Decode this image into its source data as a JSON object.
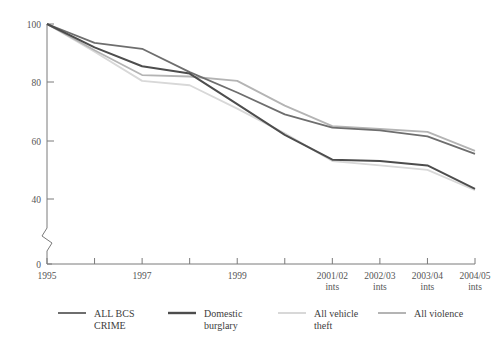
{
  "chart_data": {
    "type": "line",
    "title": "",
    "subtitle": "",
    "xlabel": "",
    "ylabel": "",
    "ylim": [
      0,
      100
    ],
    "y_ticks": [
      0,
      40,
      60,
      80,
      100
    ],
    "y_axis_break": true,
    "y_axis_break_between": [
      0,
      40
    ],
    "grid": false,
    "legend_position": "bottom",
    "categories": [
      "1995",
      "1996",
      "1997",
      "1998",
      "1999",
      "2000",
      "2001/02 ints",
      "2002/03 ints",
      "2003/04 ints",
      "2004/05 ints"
    ],
    "x_tick_labels": [
      "1995",
      "",
      "1997",
      "",
      "1999",
      "",
      "2001/02\nints",
      "2002/03\nints",
      "2003/04\nints",
      "2004/05\nints"
    ],
    "x_tick_labels_visible": [
      {
        "index": 0,
        "line1": "1995",
        "line2": ""
      },
      {
        "index": 2,
        "line1": "1997",
        "line2": ""
      },
      {
        "index": 4,
        "line1": "1999",
        "line2": ""
      },
      {
        "index": 6,
        "line1": "2001/02",
        "line2": "ints"
      },
      {
        "index": 7,
        "line1": "2002/03",
        "line2": "ints"
      },
      {
        "index": 8,
        "line1": "2003/04",
        "line2": "ints"
      },
      {
        "index": 9,
        "line1": "2004/05",
        "line2": "ints"
      }
    ],
    "series": [
      {
        "name": "ALL BCS CRIME",
        "color": "#6e6e6e",
        "values": [
          100,
          93.5,
          91.5,
          83.5,
          76.5,
          69.0,
          64.5,
          63.5,
          61.5,
          55.5
        ]
      },
      {
        "name": "Domestic burglary",
        "color": "#4d4d4d",
        "values": [
          100,
          92.0,
          85.5,
          83.0,
          72.5,
          62.0,
          53.5,
          53.0,
          51.5,
          43.5
        ]
      },
      {
        "name": "All vehicle theft",
        "color": "#d8d8d8",
        "values": [
          100,
          90.5,
          80.5,
          79.0,
          71.0,
          62.5,
          53.0,
          51.5,
          50.0,
          43.0
        ]
      },
      {
        "name": "All violence",
        "color": "#b4b4b4",
        "values": [
          100,
          91.0,
          82.5,
          82.0,
          80.5,
          72.0,
          65.0,
          64.0,
          63.0,
          56.5
        ]
      }
    ]
  },
  "legend": {
    "items": [
      {
        "label_line1": "ALL BCS",
        "label_line2": "CRIME",
        "color": "#6e6e6e"
      },
      {
        "label_line1": "Domestic",
        "label_line2": "burglary",
        "color": "#4d4d4d"
      },
      {
        "label_line1": "All vehicle",
        "label_line2": "theft",
        "color": "#d8d8d8"
      },
      {
        "label_line1": "All violence",
        "label_line2": "",
        "color": "#b4b4b4"
      }
    ]
  },
  "axis": {
    "y_labels": [
      "100",
      "80",
      "60",
      "40",
      "0"
    ]
  },
  "colors": {
    "axis": "#7a7a7a",
    "text": "#4a4a4a",
    "background": "#ffffff"
  }
}
